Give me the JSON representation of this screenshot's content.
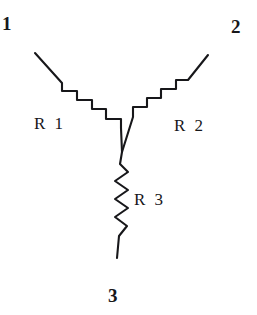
{
  "figure": {
    "kind": "hand-drawn-schematic",
    "background_color": "#ffffff",
    "ink_color": "#17171a",
    "width": 257,
    "height": 315
  },
  "terminals": [
    {
      "id": "1",
      "label": "1",
      "position": "top-left"
    },
    {
      "id": "2",
      "label": "2",
      "position": "top-right"
    },
    {
      "id": "3",
      "label": "3",
      "position": "bottom"
    }
  ],
  "components": [
    {
      "id": "R1",
      "label": "R 1",
      "type": "resistor",
      "between": "terminal 1 and center node"
    },
    {
      "id": "R2",
      "label": "R 2",
      "type": "resistor",
      "between": "terminal 2 and center node"
    },
    {
      "id": "R3",
      "label": "R 3",
      "type": "resistor",
      "between": "terminal 3 and center node"
    }
  ],
  "junction": {
    "name": "center-node",
    "x": 122,
    "y": 152
  },
  "geometry": {
    "branch_r1_path": "M 35 53 L 62 83 L 62 91 L 77 91 L 77 100 L 92 100 L 92 109 L 106 109 L 106 119 L 121 119 L 121 128 L 122 152",
    "branch_r2_path": "M 208 55 L 188 80 L 176 80 L 176 89 L 161 89 L 161 98 L 147 98 L 147 107 L 133 107 L 133 117 L 122 152",
    "branch_r3_path": "M 122 152 L 120 164 L 128 172 L 115 181 L 128 190 L 115 199 L 128 208 L 115 217 L 127 226 L 119 236 L 117 258"
  }
}
